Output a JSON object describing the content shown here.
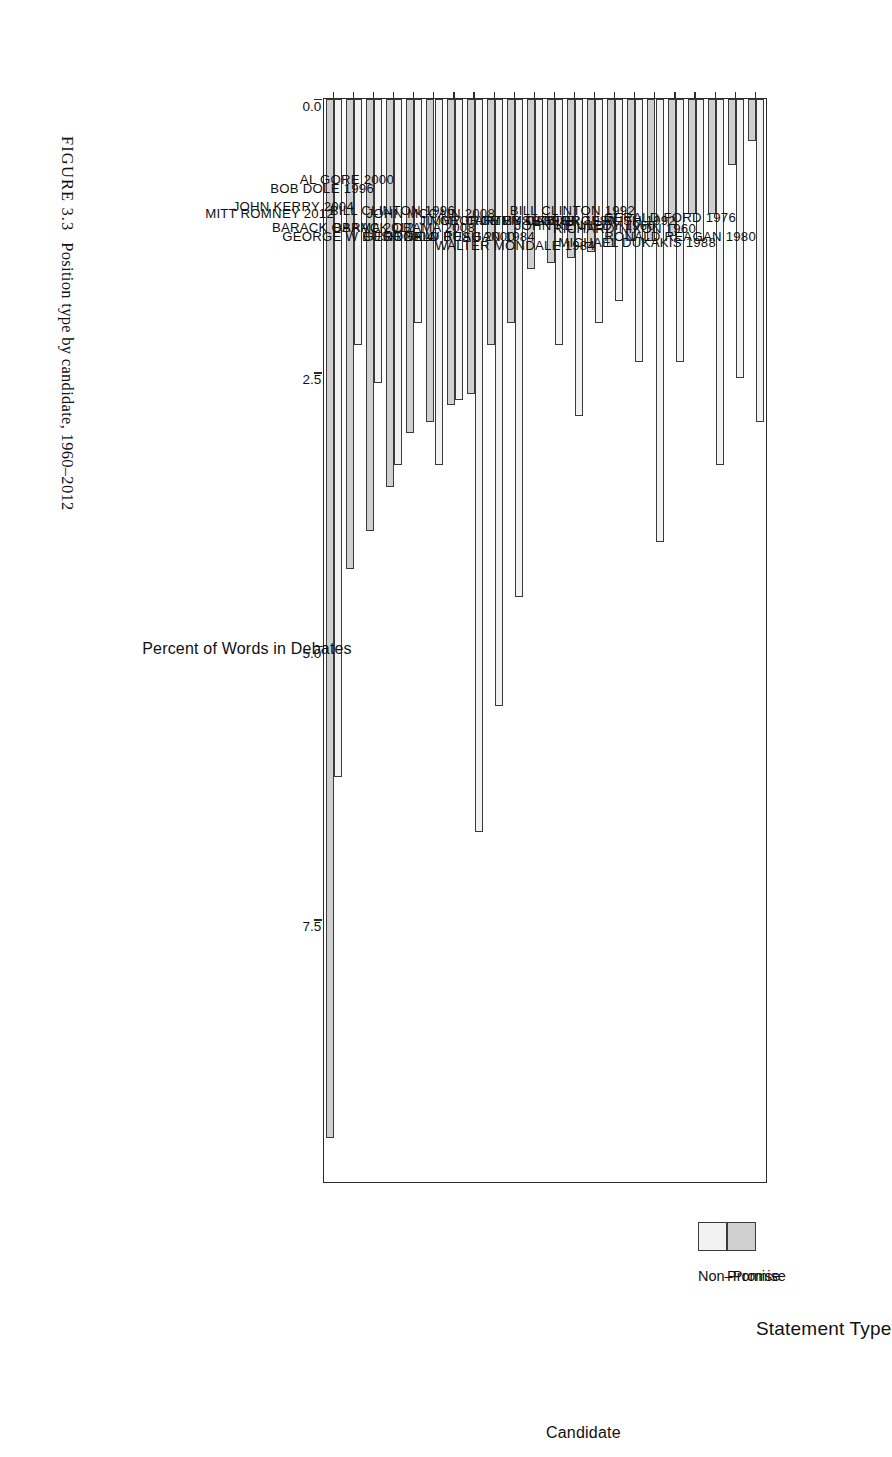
{
  "figure": {
    "number_label": "FIGURE 3.3",
    "caption_text": "Position type by candidate, 1960–2012"
  },
  "legend": {
    "title": "Statement Type",
    "items": [
      {
        "label": "Promise",
        "color": "#cfcfcf",
        "icon": "square-swatch-icon"
      },
      {
        "label": "Non–Promise",
        "color": "#f2f2f2",
        "icon": "square-swatch-icon"
      }
    ]
  },
  "axes": {
    "value_axis_title": "Percent of Words in Debates",
    "category_axis_title": "Candidate",
    "value_ticks": [
      "0.0",
      "2.5",
      "5.0",
      "7.5"
    ]
  },
  "chart_data": {
    "type": "bar",
    "orientation": "horizontal",
    "title": "Position type by candidate, 1960–2012",
    "xlabel": "Percent of Words in Debates",
    "ylabel": "Candidate",
    "xlim": [
      0,
      9.9
    ],
    "grid": false,
    "legend_position": "right",
    "legend_title": "Statement Type",
    "categories": [
      "RONALD REAGAN 1980",
      "GERALD FORD 1976",
      "MICHAEL DUKAKIS 1988",
      "RICHARD NIXON 1960",
      "GEORGE BUSH 1992",
      "JOHN KENNEDY 1960",
      "BILL CLINTON 1992",
      "JIMMY CARTER 1980",
      "WALTER MONDALE 1984",
      "GEORGE BUSH 1988",
      "JIMMY CARTER 1976",
      "RONALD REAGAN 1984",
      "GEORGE W BUSH 2000",
      "JOHN MCCAIN 2008",
      "BARACK OBAMA 2008",
      "BILL CLINTON 1996",
      "GEORGE W BUSH 2004",
      "BARACK OBAMA 2012",
      "AL GORE 2000",
      "BOB DOLE 1996",
      "JOHN KERRY 2004",
      "MITT ROMNEY 2012"
    ],
    "series": [
      {
        "name": "Non–Promise",
        "color": "#f2f2f2",
        "values": [
          2.95,
          2.55,
          3.35,
          1.3,
          2.4,
          4.05,
          2.4,
          1.85,
          2.05,
          2.9,
          2.25,
          1.15,
          4.55,
          5.55,
          6.7,
          2.75,
          3.35,
          2.05,
          3.35,
          2.6,
          2.25,
          6.2
        ]
      },
      {
        "name": "Promise",
        "color": "#cfcfcf",
        "values": [
          0.38,
          0.6,
          1.05,
          1.05,
          1.25,
          1.3,
          1.3,
          1.35,
          1.4,
          1.45,
          1.5,
          1.55,
          2.05,
          2.25,
          2.7,
          2.8,
          2.95,
          3.05,
          3.55,
          3.95,
          4.3,
          9.5
        ]
      }
    ]
  }
}
